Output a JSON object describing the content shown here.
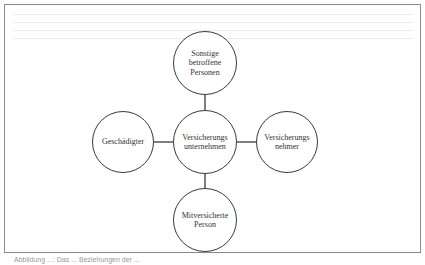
{
  "diagram": {
    "type": "relationship-diagram",
    "center_node": {
      "id": "versicherungsunternehmen",
      "label": "Versicherungs\nunternehmen"
    },
    "nodes": [
      {
        "id": "sonstige",
        "label": "Sonstige\nbetroffene\nPersonen",
        "position": "top"
      },
      {
        "id": "geschaedigter",
        "label": "Geschädigter",
        "position": "left"
      },
      {
        "id": "versicherungsnehmer",
        "label": "Versicherungs\nnehmer",
        "position": "right"
      },
      {
        "id": "mitversicherte",
        "label": "Mitversicherte\nPerson",
        "position": "bottom"
      }
    ],
    "edges": [
      [
        "versicherungsunternehmen",
        "sonstige"
      ],
      [
        "versicherungsunternehmen",
        "geschaedigter"
      ],
      [
        "versicherungsunternehmen",
        "versicherungsnehmer"
      ],
      [
        "versicherungsunternehmen",
        "mitversicherte"
      ]
    ],
    "caption": "Abbildung ...: Das ... Beziehungen der ..."
  },
  "colors": {
    "stroke": "#3a3a3a",
    "frame": "#8a8a8a",
    "background": "#ffffff"
  }
}
